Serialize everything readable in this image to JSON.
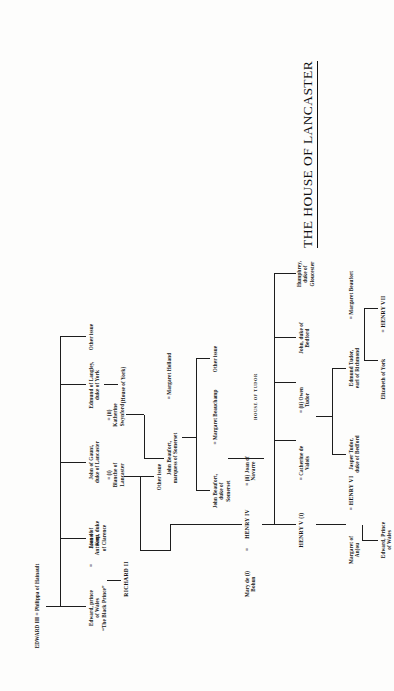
{
  "document": {
    "title": "THE HOUSE OF LANCASTER",
    "footer_label": "HOUSE OF TUDOR",
    "orientation": "rotated-90-ccw",
    "ink_color": "#151515",
    "paper_color": "#fdfdfc"
  },
  "tree": {
    "root": "EDWARD III = Philippa of Hainault",
    "nodes": [
      {
        "id": "edward3",
        "label": "EDWARD III = Philippa of Hainault"
      },
      {
        "id": "black-prince",
        "label": "Edward, prince\nof Wales\n“The Black Prince”"
      },
      {
        "id": "joan-kent",
        "label": "Joan of\nKent"
      },
      {
        "id": "richard2",
        "label": "RICHARD II"
      },
      {
        "id": "lionel",
        "label": "Lionel of\nAntwerp, duke\nof Clarence"
      },
      {
        "id": "john-gaunt",
        "label": "John of Gaunt,\nduke of Lancaster"
      },
      {
        "id": "blanche",
        "label": "= (i)\nBlanche of\nLancaster"
      },
      {
        "id": "katherine-swynford",
        "label": "= (ii)\nKatherine\nSwynford"
      },
      {
        "id": "edmund-langley",
        "label": "Edmund of Langley,\nduke of York"
      },
      {
        "id": "house-of-york",
        "label": "(House of York)"
      },
      {
        "id": "other-issue-top",
        "label": "Other issue"
      },
      {
        "id": "other-issue-gaunt",
        "label": "Other issue"
      },
      {
        "id": "other-issue-beaufort",
        "label": "Other issue"
      },
      {
        "id": "mary-bohun",
        "label": "Mary de (i)\nBohun"
      },
      {
        "id": "henry4",
        "label": "HENRY IV"
      },
      {
        "id": "joan-navarre",
        "label": "= (ii)  Joan of\nNavarre"
      },
      {
        "id": "henry5",
        "label": "HENRY V (i)"
      },
      {
        "id": "catherine-valois",
        "label": "=  Catherine de\nValois"
      },
      {
        "id": "owen-tudor",
        "label": "= (ii)  Owen\nTudor"
      },
      {
        "id": "john-bedford",
        "label": "John, duke of\nBedford"
      },
      {
        "id": "humphrey-gloucester",
        "label": "Humphrey,\nduke of\nGloucester"
      },
      {
        "id": "john-beaufort-marquess",
        "label": "John Beaufort,\nmarquess of Somerset"
      },
      {
        "id": "margaret-holland",
        "label": "=  Margaret Holland"
      },
      {
        "id": "john-beaufort-duke",
        "label": "John Beaufort,\nduke of\nSomerset"
      },
      {
        "id": "margaret-beauchamp",
        "label": "=  Margaret Beauchamp"
      },
      {
        "id": "margaret-anjou",
        "label": "Margaret of\nAnjou"
      },
      {
        "id": "henry6",
        "label": "=  HENRY VI"
      },
      {
        "id": "edward-prince-wales",
        "label": "Edward, Prince\nof Wales"
      },
      {
        "id": "jasper-tudor",
        "label": "Jasper Tudor,\nduke of Bedford"
      },
      {
        "id": "edmund-tudor",
        "label": "Edmund Tudor,\nearl of Richmond"
      },
      {
        "id": "margaret-beaufort",
        "label": "=  Margaret Beaufort"
      },
      {
        "id": "elizabeth-york",
        "label": "Elizabeth of York"
      },
      {
        "id": "henry7",
        "label": "=  HENRY VII"
      }
    ]
  }
}
